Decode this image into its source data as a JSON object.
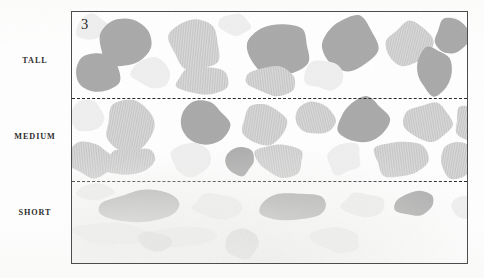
{
  "figure": {
    "number": "3",
    "frame": {
      "x": 71,
      "y": 11,
      "width": 397,
      "height": 253
    },
    "background_color": "#ffffff",
    "border_color": "#4a4a4a"
  },
  "row_labels": [
    {
      "id": "tall",
      "text": "TALL"
    },
    {
      "id": "medium",
      "text": "MEDIUM"
    },
    {
      "id": "short",
      "text": "SHORT"
    }
  ],
  "dividers": [
    {
      "id": "divider-1",
      "y": 86,
      "style": "dashed",
      "color": "#242424"
    },
    {
      "id": "divider-2",
      "y": 169,
      "style": "dashed",
      "color": "#242424"
    }
  ],
  "palette": {
    "solid_gray": "#a9a9a9",
    "striped_gray": "#c4c4c4",
    "striped_stripe": "#d8d8d8",
    "pale_gray": "#efefef",
    "paper": "#ffffff",
    "ink": "#272727"
  },
  "chart_data": {
    "type": "diagram",
    "title": "3",
    "bands": [
      "TALL",
      "MEDIUM",
      "SHORT"
    ],
    "band_boundaries_px": [
      11,
      97,
      180,
      264
    ],
    "fill_classes": [
      "solid",
      "striped",
      "pale"
    ],
    "blob_counts": {
      "TALL": 14,
      "MEDIUM": 16,
      "SHORT": 12
    }
  },
  "blobs": {
    "tall": [
      {
        "x": 2,
        "y": 1,
        "w": 34,
        "h": 30,
        "fill": "pale",
        "seed": 11,
        "rot": -8
      },
      {
        "x": 22,
        "y": 4,
        "w": 62,
        "h": 55,
        "fill": "solid",
        "seed": 2,
        "rot": 6
      },
      {
        "x": 96,
        "y": 3,
        "w": 55,
        "h": 58,
        "fill": "striped",
        "seed": 3,
        "rot": -4
      },
      {
        "x": 146,
        "y": 0,
        "w": 34,
        "h": 26,
        "fill": "pale",
        "seed": 12,
        "rot": 10
      },
      {
        "x": 170,
        "y": 6,
        "w": 74,
        "h": 60,
        "fill": "solid",
        "seed": 4,
        "rot": -6
      },
      {
        "x": 245,
        "y": 2,
        "w": 62,
        "h": 58,
        "fill": "solid",
        "seed": 5,
        "rot": 12
      },
      {
        "x": 311,
        "y": 8,
        "w": 52,
        "h": 50,
        "fill": "striped",
        "seed": 6,
        "rot": -10
      },
      {
        "x": 360,
        "y": 5,
        "w": 40,
        "h": 40,
        "fill": "solid",
        "seed": 7,
        "rot": 4
      },
      {
        "x": 2,
        "y": 38,
        "w": 48,
        "h": 45,
        "fill": "solid",
        "seed": 8,
        "rot": -14
      },
      {
        "x": 58,
        "y": 42,
        "w": 42,
        "h": 36,
        "fill": "pale",
        "seed": 13,
        "rot": 8
      },
      {
        "x": 100,
        "y": 52,
        "w": 62,
        "h": 32,
        "fill": "striped",
        "seed": 9,
        "rot": -3
      },
      {
        "x": 172,
        "y": 54,
        "w": 58,
        "h": 30,
        "fill": "striped",
        "seed": 10,
        "rot": 5
      },
      {
        "x": 232,
        "y": 46,
        "w": 42,
        "h": 34,
        "fill": "pale",
        "seed": 14,
        "rot": -7
      },
      {
        "x": 340,
        "y": 32,
        "w": 44,
        "h": 52,
        "fill": "solid",
        "seed": 15,
        "rot": 9
      }
    ],
    "medium": [
      {
        "x": -4,
        "y": 2,
        "w": 40,
        "h": 34,
        "fill": "pale",
        "seed": 21,
        "rot": 6
      },
      {
        "x": 28,
        "y": 0,
        "w": 62,
        "h": 56,
        "fill": "striped",
        "seed": 22,
        "rot": -8
      },
      {
        "x": 106,
        "y": 0,
        "w": 52,
        "h": 48,
        "fill": "solid",
        "seed": 23,
        "rot": 5
      },
      {
        "x": 166,
        "y": 2,
        "w": 50,
        "h": 46,
        "fill": "striped",
        "seed": 24,
        "rot": -6
      },
      {
        "x": 222,
        "y": 0,
        "w": 44,
        "h": 40,
        "fill": "striped",
        "seed": 25,
        "rot": 10
      },
      {
        "x": 262,
        "y": -2,
        "w": 60,
        "h": 50,
        "fill": "solid",
        "seed": 26,
        "rot": -5
      },
      {
        "x": 330,
        "y": 2,
        "w": 56,
        "h": 44,
        "fill": "striped",
        "seed": 27,
        "rot": 7
      },
      {
        "x": 382,
        "y": 6,
        "w": 30,
        "h": 40,
        "fill": "striped",
        "seed": 28,
        "rot": -9
      },
      {
        "x": -6,
        "y": 42,
        "w": 50,
        "h": 38,
        "fill": "striped",
        "seed": 29,
        "rot": 4
      },
      {
        "x": 30,
        "y": 48,
        "w": 54,
        "h": 32,
        "fill": "striped",
        "seed": 30,
        "rot": -6
      },
      {
        "x": 96,
        "y": 44,
        "w": 44,
        "h": 38,
        "fill": "pale",
        "seed": 31,
        "rot": 8
      },
      {
        "x": 150,
        "y": 48,
        "w": 34,
        "h": 32,
        "fill": "solid",
        "seed": 32,
        "rot": -4
      },
      {
        "x": 180,
        "y": 44,
        "w": 54,
        "h": 36,
        "fill": "striped",
        "seed": 33,
        "rot": 6
      },
      {
        "x": 252,
        "y": 42,
        "w": 40,
        "h": 36,
        "fill": "pale",
        "seed": 34,
        "rot": -8
      },
      {
        "x": 300,
        "y": 38,
        "w": 56,
        "h": 44,
        "fill": "striped",
        "seed": 35,
        "rot": 5
      },
      {
        "x": 366,
        "y": 44,
        "w": 40,
        "h": 38,
        "fill": "striped",
        "seed": 36,
        "rot": -7
      }
    ],
    "short": [
      {
        "x": 2,
        "y": 2,
        "w": 40,
        "h": 18,
        "fill": "pale",
        "seed": 41,
        "rot": 3
      },
      {
        "x": 24,
        "y": 8,
        "w": 84,
        "h": 34,
        "fill": "solid",
        "seed": 42,
        "rot": -4
      },
      {
        "x": 118,
        "y": 12,
        "w": 54,
        "h": 26,
        "fill": "pale",
        "seed": 43,
        "rot": 5
      },
      {
        "x": 186,
        "y": 10,
        "w": 72,
        "h": 32,
        "fill": "solid",
        "seed": 44,
        "rot": -3
      },
      {
        "x": 268,
        "y": 10,
        "w": 48,
        "h": 28,
        "fill": "pale",
        "seed": 45,
        "rot": 6
      },
      {
        "x": 322,
        "y": 10,
        "w": 44,
        "h": 26,
        "fill": "solid",
        "seed": 46,
        "rot": -5
      },
      {
        "x": 376,
        "y": 14,
        "w": 30,
        "h": 24,
        "fill": "pale",
        "seed": 47,
        "rot": 4
      },
      {
        "x": -4,
        "y": 40,
        "w": 80,
        "h": 26,
        "fill": "pale",
        "seed": 48,
        "rot": 2
      },
      {
        "x": 60,
        "y": 44,
        "w": 88,
        "h": 24,
        "fill": "pale",
        "seed": 49,
        "rot": -2
      },
      {
        "x": 64,
        "y": 50,
        "w": 38,
        "h": 22,
        "fill": "striped",
        "seed": 50,
        "rot": 5
      },
      {
        "x": 150,
        "y": 48,
        "w": 40,
        "h": 32,
        "fill": "striped",
        "seed": 51,
        "rot": -6
      },
      {
        "x": 236,
        "y": 46,
        "w": 56,
        "h": 26,
        "fill": "pale",
        "seed": 52,
        "rot": 3
      }
    ]
  }
}
